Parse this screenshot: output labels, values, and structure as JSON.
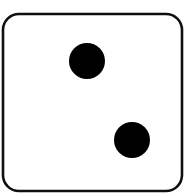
{
  "scene": {
    "width": 186,
    "height": 196,
    "background_color": "#ffffff",
    "subject": "die",
    "description": "Single white six-sided die showing the face value two"
  },
  "die": {
    "name": "die-face-two",
    "face_value": 2,
    "face_value_label": "2",
    "pip_count": 2,
    "pip_arrangement": "diagonal",
    "body": {
      "x": 3,
      "y": 14,
      "width": 179,
      "height": 177,
      "corner_radius": 16,
      "fill_color": "#ffffff",
      "border_color": "#0f0f0f",
      "border_width": 2.6
    },
    "pips": [
      {
        "name": "pip-upper-left",
        "position": "upper-middle",
        "cx": 87,
        "cy": 61,
        "r": 18,
        "color": "#000000"
      },
      {
        "name": "pip-lower-right",
        "position": "lower-right",
        "cx": 132,
        "cy": 140,
        "r": 18,
        "color": "#000000"
      }
    ]
  }
}
